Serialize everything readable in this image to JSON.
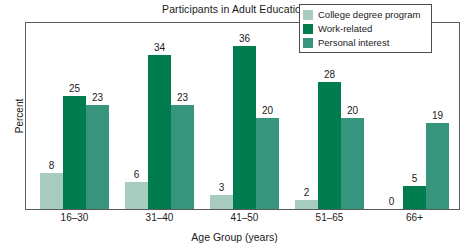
{
  "chart_data": {
    "type": "bar",
    "title": "Participants in Adult Education",
    "xlabel": "Age Group (years)",
    "ylabel": "Percent",
    "categories": [
      "16–30",
      "31–40",
      "41–50",
      "51–65",
      "66+"
    ],
    "series": [
      {
        "name": "College degree program",
        "color": "#a8cbc0",
        "values": [
          8,
          6,
          3,
          2,
          0
        ]
      },
      {
        "name": "Work-related",
        "color": "#017c4f",
        "values": [
          25,
          34,
          36,
          28,
          5
        ]
      },
      {
        "name": "Personal interest",
        "color": "#37957d",
        "values": [
          23,
          23,
          20,
          20,
          19
        ]
      }
    ],
    "ylim": [
      0,
      41
    ],
    "grid": false,
    "y_ticks_shown": false,
    "legend_position": "top-right",
    "data_labels_shown": true
  },
  "legend": {
    "entries": [
      {
        "label": "College degree program",
        "color": "#a8cbc0"
      },
      {
        "label": "Work-related",
        "color": "#017c4f"
      },
      {
        "label": "Personal interest",
        "color": "#37957d"
      }
    ]
  },
  "axes": {
    "plot_border_color": "#5a5a5a"
  }
}
